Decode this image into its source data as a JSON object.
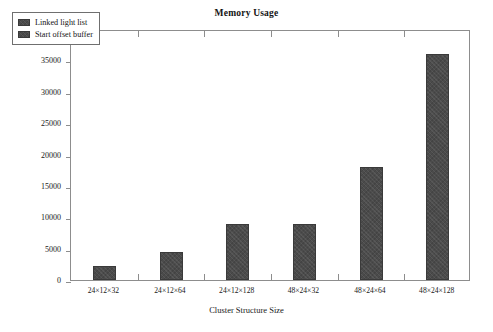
{
  "chart_data": {
    "type": "bar",
    "title": "Memory Usage",
    "xlabel": "Cluster Structure Size",
    "ylabel": "Video Memory in kB",
    "categories": [
      "24×12×32",
      "24×12×64",
      "24×12×128",
      "48×24×32",
      "48×24×64",
      "48×24×128"
    ],
    "series": [
      {
        "name": "Start offset buffer",
        "values": [
          2200,
          4500,
          9000,
          9000,
          18000,
          36000
        ]
      }
    ],
    "legend": [
      {
        "label": "Linked light list",
        "color": "#4b4b4b"
      },
      {
        "label": "Start offset buffer",
        "color": "#4b4b4b"
      }
    ],
    "legend_position": "top-left",
    "ylim": [
      0,
      40000
    ],
    "yticks": [
      0,
      5000,
      10000,
      15000,
      20000,
      25000,
      30000,
      35000,
      40000
    ],
    "ytick_labels": [
      "0",
      "5000",
      "10000",
      "15000",
      "20000",
      "25000",
      "30000",
      "35000",
      "40000"
    ],
    "grid": false,
    "bar_color": "#4b4b4b",
    "frame_color": "#8d8d8d",
    "background": "#ffffff"
  }
}
